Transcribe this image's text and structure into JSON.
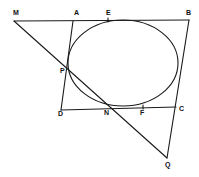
{
  "diagram": {
    "type": "geometry",
    "stroke_color": "#1a1a1a",
    "background": "#ffffff",
    "ellipse": {
      "cx": 123,
      "cy": 63,
      "rx": 55,
      "ry": 43
    },
    "points": {
      "M": {
        "label": "M",
        "x": 14,
        "y": 21,
        "lx": 13,
        "ly": 15
      },
      "A": {
        "label": "A",
        "x": 73,
        "y": 21,
        "lx": 74,
        "ly": 15
      },
      "E": {
        "label": "E",
        "x": 108,
        "y": 20,
        "lx": 106,
        "ly": 15
      },
      "B": {
        "label": "B",
        "x": 189,
        "y": 20,
        "lx": 186,
        "ly": 15
      },
      "P": {
        "label": "P",
        "x": 67,
        "y": 72,
        "lx": 60,
        "ly": 73
      },
      "D": {
        "label": "D",
        "x": 61,
        "y": 110,
        "lx": 58,
        "ly": 115
      },
      "N": {
        "label": "N",
        "x": 108,
        "y": 107,
        "lx": 104,
        "ly": 114
      },
      "F": {
        "label": "F",
        "x": 143,
        "y": 107,
        "lx": 140,
        "ly": 114
      },
      "C": {
        "label": "C",
        "x": 176,
        "y": 107,
        "lx": 178,
        "ly": 110
      },
      "Q": {
        "label": "Q",
        "x": 167,
        "y": 158,
        "lx": 165,
        "ly": 166
      }
    },
    "segments": [
      [
        "M",
        "B"
      ],
      [
        "A",
        "D"
      ],
      [
        "D",
        "C"
      ],
      [
        "B",
        "Q"
      ],
      [
        "M",
        "Q"
      ]
    ]
  }
}
